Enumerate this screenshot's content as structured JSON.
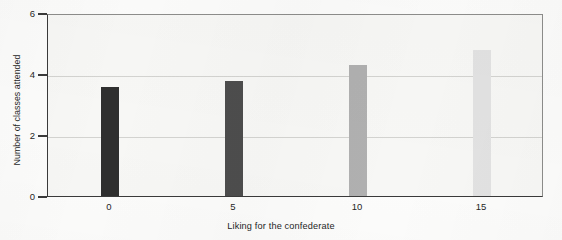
{
  "chart_data": {
    "type": "bar",
    "title": "",
    "xlabel": "Liking for the confederate",
    "ylabel": "Number of classes attended",
    "categories": [
      "0",
      "5",
      "10",
      "15"
    ],
    "x": [
      0,
      5,
      10,
      15
    ],
    "values": [
      3.58,
      3.77,
      4.3,
      4.8
    ],
    "bar_colors": [
      "#2f2f2f",
      "#4d4d4d",
      "#b0b0b0",
      "#e2e2e2"
    ],
    "xlim": [
      -2.5,
      17.5
    ],
    "ylim": [
      0,
      6
    ],
    "ytick_labels": [
      "0",
      "2",
      "4",
      "6"
    ],
    "yticks": [
      0,
      2,
      4,
      6
    ],
    "xtick_labels": [
      "0",
      "5",
      "10",
      "15"
    ],
    "grid": "horizontal-faint",
    "legend": "none",
    "plot_background": "#f7f7f5",
    "axis_color": "#3a3a3a"
  },
  "figure": {
    "background": "#fcfcfb"
  }
}
